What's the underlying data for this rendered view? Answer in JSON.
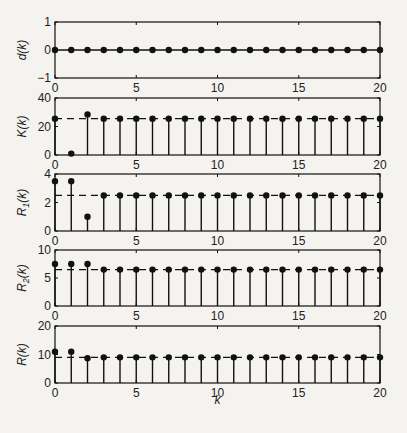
{
  "chart_data": [
    {
      "type": "stem",
      "ylabel": "d(k)",
      "ylim": [
        -1,
        1
      ],
      "yticks": [
        -1,
        0,
        1
      ],
      "x": [
        0,
        1,
        2,
        3,
        4,
        5,
        6,
        7,
        8,
        9,
        10,
        11,
        12,
        13,
        14,
        15,
        16,
        17,
        18,
        19,
        20
      ],
      "values": [
        0,
        0,
        0,
        0,
        0,
        0,
        0,
        0,
        0,
        0,
        0,
        0,
        0,
        0,
        0,
        0,
        0,
        0,
        0,
        0,
        0
      ],
      "reference_line": null
    },
    {
      "type": "stem",
      "ylabel": "K(k)",
      "ylim": [
        0,
        40
      ],
      "yticks": [
        0,
        20,
        40
      ],
      "x": [
        0,
        1,
        2,
        3,
        4,
        5,
        6,
        7,
        8,
        9,
        10,
        11,
        12,
        13,
        14,
        15,
        16,
        17,
        18,
        19,
        20
      ],
      "values": [
        25.5,
        1,
        28.5,
        25.5,
        25.5,
        25.5,
        25.5,
        25.5,
        25.5,
        25.5,
        25.5,
        25.5,
        25.5,
        25.5,
        25.5,
        25.5,
        25.5,
        25.5,
        25.5,
        25.5,
        25.5
      ],
      "reference_line": 25.5
    },
    {
      "type": "stem",
      "ylabel": "R1(k)",
      "ylim": [
        0,
        4
      ],
      "yticks": [
        0,
        2,
        4
      ],
      "x": [
        0,
        1,
        2,
        3,
        4,
        5,
        6,
        7,
        8,
        9,
        10,
        11,
        12,
        13,
        14,
        15,
        16,
        17,
        18,
        19,
        20
      ],
      "values": [
        3.5,
        3.5,
        1,
        2.5,
        2.5,
        2.5,
        2.5,
        2.5,
        2.5,
        2.5,
        2.5,
        2.5,
        2.5,
        2.5,
        2.5,
        2.5,
        2.5,
        2.5,
        2.5,
        2.5,
        2.5
      ],
      "reference_line": 2.5
    },
    {
      "type": "stem",
      "ylabel": "R2(k)",
      "ylim": [
        0,
        10
      ],
      "yticks": [
        0,
        5,
        10
      ],
      "x": [
        0,
        1,
        2,
        3,
        4,
        5,
        6,
        7,
        8,
        9,
        10,
        11,
        12,
        13,
        14,
        15,
        16,
        17,
        18,
        19,
        20
      ],
      "values": [
        7.5,
        7.5,
        7.5,
        6.5,
        6.5,
        6.5,
        6.5,
        6.5,
        6.5,
        6.5,
        6.5,
        6.5,
        6.5,
        6.5,
        6.5,
        6.5,
        6.5,
        6.5,
        6.5,
        6.5,
        6.5
      ],
      "reference_line": 6.5
    },
    {
      "type": "stem",
      "ylabel": "R(k)",
      "xlabel": "k",
      "ylim": [
        0,
        20
      ],
      "yticks": [
        0,
        10,
        20
      ],
      "x": [
        0,
        1,
        2,
        3,
        4,
        5,
        6,
        7,
        8,
        9,
        10,
        11,
        12,
        13,
        14,
        15,
        16,
        17,
        18,
        19,
        20
      ],
      "values": [
        11,
        11,
        8.7,
        9,
        9,
        9,
        9,
        9,
        9,
        9,
        9,
        9,
        9,
        9,
        9,
        9,
        9,
        9,
        9,
        9,
        9
      ],
      "reference_line": 9
    }
  ],
  "xaxis": {
    "xlim": [
      0,
      20
    ],
    "xticks": [
      0,
      5,
      10,
      15,
      20
    ],
    "xlabel": "k"
  },
  "colors": {
    "ink": "#111111",
    "background": "#f4f3ef"
  }
}
